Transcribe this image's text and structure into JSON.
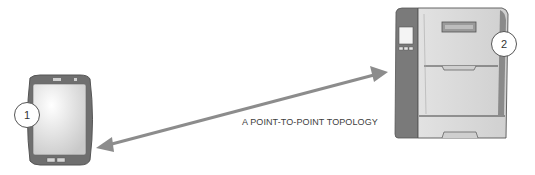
{
  "diagram": {
    "caption": "A POINT-TO-POINT TOPOLOGY",
    "nodes": [
      {
        "id": "1",
        "label": "1",
        "device": "tablet-icon"
      },
      {
        "id": "2",
        "label": "2",
        "device": "printer-icon"
      }
    ],
    "connection": {
      "type": "bidirectional-arrow",
      "from": "1",
      "to": "2",
      "color": "#8c8c8c"
    },
    "colors": {
      "device_frame": "#6f6f6f",
      "device_body": "#d9d9d9",
      "badge_border": "#555555"
    }
  }
}
